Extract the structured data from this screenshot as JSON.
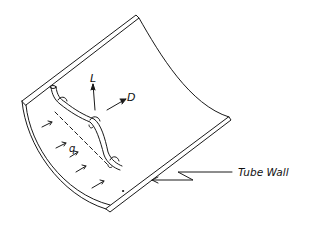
{
  "diagram": {
    "type": "technical-illustration",
    "labels": {
      "lift": "L",
      "drag": "D",
      "flow": "q",
      "tube_wall": "Tube Wall"
    },
    "colors": {
      "line": "#1a1a1a",
      "background": "#ffffff"
    }
  }
}
